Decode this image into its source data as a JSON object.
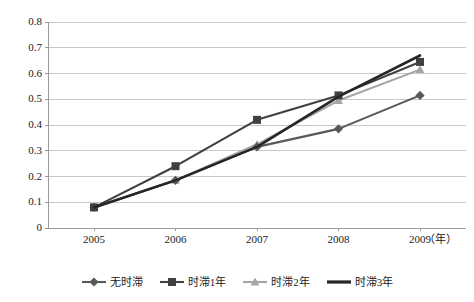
{
  "chart_data": {
    "type": "line",
    "title": "",
    "xlabel": "",
    "ylabel": "",
    "x_unit_label": "（年）",
    "categories": [
      "2005",
      "2006",
      "2007",
      "2008",
      "2009"
    ],
    "ylim": [
      0,
      0.8
    ],
    "y_ticks": [
      "0.8",
      "0.7",
      "0.6",
      "0.5",
      "0.4",
      "0.3",
      "0.2",
      "0.1",
      "0"
    ],
    "y_tick_values": [
      0.8,
      0.7,
      0.6,
      0.5,
      0.4,
      0.3,
      0.2,
      0.1,
      0
    ],
    "grid": "horizontal",
    "legend_position": "bottom",
    "series": [
      {
        "name": "无时滞",
        "marker": "diamond",
        "color": "#595959",
        "values": [
          0.08,
          0.185,
          0.315,
          0.385,
          0.515
        ]
      },
      {
        "name": "时滞1年",
        "marker": "square",
        "color": "#404040",
        "values": [
          0.08,
          0.24,
          0.42,
          0.515,
          0.645
        ]
      },
      {
        "name": "时滞2年",
        "marker": "triangle",
        "color": "#a6a6a6",
        "values": [
          0.08,
          0.185,
          0.325,
          0.495,
          0.615
        ]
      },
      {
        "name": "时滞3年",
        "marker": "none",
        "color": "#262626",
        "values": [
          0.08,
          0.185,
          0.315,
          0.51,
          0.67
        ]
      }
    ]
  },
  "colors": {
    "axis": "#9a9a9a",
    "grid": "#c8c8c8",
    "text": "#1a1a1a",
    "background": "#ffffff"
  }
}
